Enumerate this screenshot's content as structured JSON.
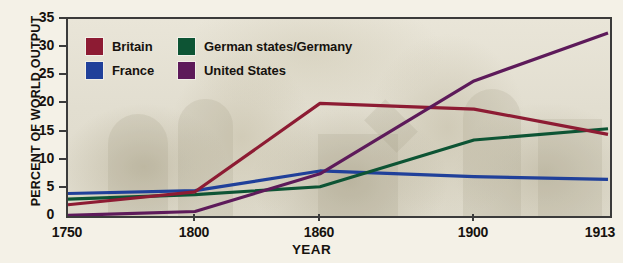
{
  "chart_data": {
    "type": "line",
    "title": "",
    "xlabel": "YEAR",
    "ylabel": "PERCENT OF WORLD OUTPUT",
    "x": [
      1750,
      1800,
      1860,
      1900,
      1913
    ],
    "x_tick_labels": [
      "1750",
      "1800",
      "1860",
      "1900",
      "1913"
    ],
    "y_tick_labels": [
      "0",
      "5",
      "10",
      "15",
      "20",
      "25",
      "30",
      "35"
    ],
    "y_ticks": [
      0,
      5,
      10,
      15,
      20,
      25,
      30,
      35
    ],
    "ylim": [
      0,
      35
    ],
    "xlim": [
      1750,
      1913
    ],
    "grid": false,
    "legend_position": "top-left-inside",
    "series": [
      {
        "name": "Britain",
        "color": "#8d1b33",
        "values": [
          2.0,
          4.3,
          20.0,
          19.0,
          14.5
        ]
      },
      {
        "name": "France",
        "color": "#20409a",
        "values": [
          4.0,
          4.5,
          8.0,
          7.0,
          6.5
        ]
      },
      {
        "name": "German states/Germany",
        "color": "#0d5434",
        "values": [
          3.0,
          3.8,
          5.2,
          13.5,
          15.5
        ]
      },
      {
        "name": "United States",
        "color": "#5d1a5a",
        "values": [
          0.1,
          0.8,
          7.5,
          24.0,
          32.5
        ]
      }
    ]
  },
  "legend": {
    "items": [
      {
        "label": "Britain",
        "color": "#8d1b33"
      },
      {
        "label": "German states/Germany",
        "color": "#0d5434"
      },
      {
        "label": "France",
        "color": "#20409a"
      },
      {
        "label": "United States",
        "color": "#5d1a5a"
      }
    ]
  },
  "axes": {
    "y_title": "PERCENT OF WORLD OUTPUT",
    "x_title": "YEAR"
  }
}
